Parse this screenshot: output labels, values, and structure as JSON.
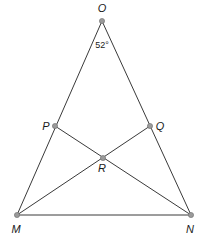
{
  "diagram": {
    "type": "geometry",
    "points": {
      "O": {
        "label": "O",
        "x": 102,
        "y": 21,
        "label_x": 102,
        "label_y": 12
      },
      "P": {
        "label": "P",
        "x": 55,
        "y": 126,
        "label_x": 46,
        "label_y": 130
      },
      "Q": {
        "label": "Q",
        "x": 150,
        "y": 126,
        "label_x": 160,
        "label_y": 130
      },
      "R": {
        "label": "R",
        "x": 103,
        "y": 158,
        "label_x": 102,
        "label_y": 172
      },
      "M": {
        "label": "M",
        "x": 17,
        "y": 215,
        "label_x": 16,
        "label_y": 233
      },
      "N": {
        "label": "N",
        "x": 191,
        "y": 215,
        "label_x": 190,
        "label_y": 233
      }
    },
    "segments": [
      {
        "from": "O",
        "to": "M"
      },
      {
        "from": "O",
        "to": "N"
      },
      {
        "from": "M",
        "to": "N"
      },
      {
        "from": "P",
        "to": "N"
      },
      {
        "from": "Q",
        "to": "M"
      }
    ],
    "angle_annotation": {
      "vertex": "O",
      "text": "52°",
      "x": 102,
      "y": 48
    }
  }
}
